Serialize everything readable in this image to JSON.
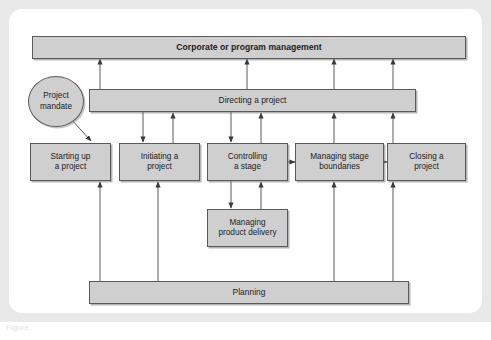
{
  "figure": {
    "caption_fragment": "Figure",
    "colors": {
      "node_fill": "#cfcfcf",
      "node_border": "#5a5a5a",
      "connector": "#5a5a5a",
      "frame": "#e9e9e9",
      "panel": "#ffffff",
      "text": "#1b1b1b"
    }
  },
  "nodes": [
    {
      "id": "corporate",
      "name": "corporate-or-program-management-bar",
      "label": "Corporate or program management",
      "shape": "bar",
      "bold": true,
      "x": 32,
      "y": 36,
      "w": 434,
      "h": 23
    },
    {
      "id": "project-mandate",
      "name": "project-mandate-ellipse",
      "label": "Project\nmandate",
      "shape": "ellipse",
      "bold": false,
      "x": 28,
      "y": 76,
      "w": 56,
      "h": 51
    },
    {
      "id": "directing",
      "name": "directing-a-project-bar",
      "label": "Directing a project",
      "shape": "bar",
      "bold": false,
      "x": 89,
      "y": 89,
      "w": 327,
      "h": 23
    },
    {
      "id": "starting-up",
      "name": "starting-up-a-project-box",
      "label": "Starting up\na project",
      "shape": "box",
      "bold": false,
      "x": 30,
      "y": 143,
      "w": 81,
      "h": 38
    },
    {
      "id": "initiating",
      "name": "initiating-a-project-box",
      "label": "Initiating a\nproject",
      "shape": "box",
      "bold": false,
      "x": 119,
      "y": 143,
      "w": 81,
      "h": 38
    },
    {
      "id": "controlling",
      "name": "controlling-a-stage-box",
      "label": "Controlling\na stage",
      "shape": "box",
      "bold": false,
      "x": 207,
      "y": 143,
      "w": 81,
      "h": 38
    },
    {
      "id": "managing-stage",
      "name": "managing-stage-boundaries-box",
      "label": "Managing stage\nboundaries",
      "shape": "box",
      "bold": false,
      "x": 295,
      "y": 143,
      "w": 89,
      "h": 38
    },
    {
      "id": "closing",
      "name": "closing-a-project-box",
      "label": "Closing a\nproject",
      "shape": "box",
      "bold": false,
      "x": 387,
      "y": 143,
      "w": 79,
      "h": 38
    },
    {
      "id": "managing-product",
      "name": "managing-product-delivery-box",
      "label": "Managing\nproduct delivery",
      "shape": "box",
      "bold": false,
      "x": 207,
      "y": 209,
      "w": 81,
      "h": 38
    },
    {
      "id": "planning",
      "name": "planning-bar",
      "label": "Planning",
      "shape": "bar",
      "bold": false,
      "x": 89,
      "y": 281,
      "w": 320,
      "h": 23
    }
  ],
  "connectors": [
    {
      "id": "c1",
      "name": "arrow-directing-to-corporate-1",
      "from": "directing",
      "to": "corporate",
      "type": "vertical-up",
      "x": 100,
      "y1": 89,
      "y2": 59
    },
    {
      "id": "c2",
      "name": "arrow-directing-to-corporate-2",
      "from": "directing",
      "to": "corporate",
      "type": "vertical-up",
      "x": 247,
      "y1": 89,
      "y2": 59
    },
    {
      "id": "c3",
      "name": "arrow-directing-to-corporate-3",
      "from": "directing",
      "to": "corporate",
      "type": "vertical-up",
      "x": 334,
      "y1": 89,
      "y2": 59
    },
    {
      "id": "c4",
      "name": "arrow-directing-to-corporate-4",
      "from": "directing",
      "to": "corporate",
      "type": "vertical-up",
      "x": 393,
      "y1": 89,
      "y2": 59
    },
    {
      "id": "c5",
      "name": "arrow-project-mandate-to-starting-up",
      "from": "project-mandate",
      "to": "starting-up",
      "type": "diagonal-down",
      "x1": 70,
      "y1": 118,
      "x2": 91,
      "y2": 141
    },
    {
      "id": "c6",
      "name": "arrow-directing-to-initiating",
      "from": "directing",
      "to": "initiating",
      "type": "vertical-down",
      "x": 143,
      "y1": 112,
      "y2": 142
    },
    {
      "id": "c7",
      "name": "arrow-initiating-to-directing",
      "from": "initiating",
      "to": "directing",
      "type": "vertical-up",
      "x": 173,
      "y1": 143,
      "y2": 113
    },
    {
      "id": "c8",
      "name": "arrow-directing-to-controlling",
      "from": "directing",
      "to": "controlling",
      "type": "vertical-down",
      "x": 231,
      "y1": 112,
      "y2": 142
    },
    {
      "id": "c9",
      "name": "arrow-controlling-to-directing",
      "from": "controlling",
      "to": "directing",
      "type": "vertical-up",
      "x": 261,
      "y1": 143,
      "y2": 113
    },
    {
      "id": "c10",
      "name": "arrow-managing-stage-to-directing",
      "from": "managing-stage",
      "to": "directing",
      "type": "vertical-up",
      "x": 334,
      "y1": 143,
      "y2": 113
    },
    {
      "id": "c11",
      "name": "arrow-closing-to-directing",
      "from": "closing",
      "to": "directing",
      "type": "vertical-up",
      "x": 393,
      "y1": 143,
      "y2": 113
    },
    {
      "id": "c12",
      "name": "arrow-controlling-to-managing-stage",
      "from": "controlling",
      "to": "managing-stage",
      "type": "horizontal-right",
      "y": 162,
      "x1": 288,
      "x2": 295
    },
    {
      "id": "c13",
      "name": "arrow-managing-stage-to-closing",
      "from": "managing-stage",
      "to": "closing",
      "type": "horizontal-right",
      "y": 162,
      "x1": 384,
      "x2": 387
    },
    {
      "id": "c14",
      "name": "arrow-controlling-to-managing-product",
      "from": "controlling",
      "to": "managing-product",
      "type": "vertical-down",
      "x": 231,
      "y1": 181,
      "y2": 208
    },
    {
      "id": "c15",
      "name": "arrow-managing-product-to-controlling",
      "from": "managing-product",
      "to": "controlling",
      "type": "vertical-up",
      "x": 261,
      "y1": 209,
      "y2": 182
    },
    {
      "id": "c16",
      "name": "arrow-planning-to-starting-up",
      "from": "planning",
      "to": "starting-up",
      "type": "vertical-up",
      "x": 100,
      "y1": 281,
      "y2": 182
    },
    {
      "id": "c17",
      "name": "arrow-planning-to-initiating",
      "from": "planning",
      "to": "initiating",
      "type": "vertical-up",
      "x": 158,
      "y1": 281,
      "y2": 182
    },
    {
      "id": "c18",
      "name": "arrow-planning-to-managing-stage",
      "from": "planning",
      "to": "managing-stage",
      "type": "vertical-up",
      "x": 334,
      "y1": 281,
      "y2": 182
    },
    {
      "id": "c19",
      "name": "arrow-planning-to-closing",
      "from": "planning",
      "to": "closing",
      "type": "vertical-up",
      "x": 393,
      "y1": 281,
      "y2": 182
    }
  ]
}
